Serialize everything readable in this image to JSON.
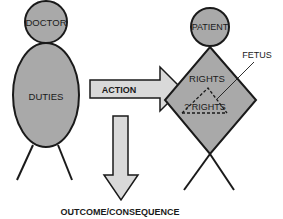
{
  "diagram": {
    "doctor": {
      "head_label": "DOCTOR",
      "body_label": "DUTIES"
    },
    "action": {
      "label": "ACTION"
    },
    "patient": {
      "head_label": "PATIENT",
      "body_label": "RIGHTS",
      "inner_label": "? RIGHTS",
      "callout_label": "FETUS"
    },
    "outcome": {
      "label": "OUTCOME/CONSEQUENCE"
    },
    "colors": {
      "figure_fill": "#a9a9a9",
      "arrow_fill": "#d9d9d9",
      "stroke": "#1a1a1a",
      "background": "#ffffff"
    }
  }
}
